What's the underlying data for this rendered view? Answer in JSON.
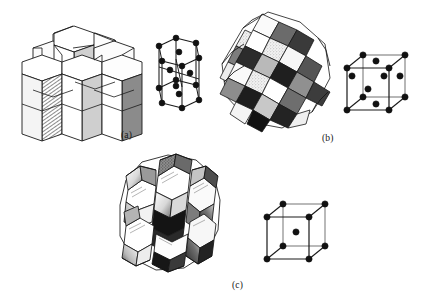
{
  "figure": {
    "background_color": "#ffffff",
    "ink_color": "#1a1a1a",
    "caption_color": "#161616"
  },
  "panels": [
    {
      "id": "a",
      "label": "(a)",
      "label_x": 121,
      "label_y": 130,
      "structure_name": "hexagonal-close-packed",
      "cluster": {
        "name": "hexagonal-prism-cluster",
        "cell_shape": "hexagonal prism",
        "prism_count": 7,
        "shading": [
          "white",
          "light-gray",
          "hatched",
          "dark-gray"
        ]
      },
      "unit_cell": {
        "name": "hcp-unit-cell",
        "shape": "hexagonal prism",
        "corner_atoms": 12,
        "face_center_atoms": 2,
        "interior_atoms": 3,
        "total_atom_markers": 17
      }
    },
    {
      "id": "b",
      "label": "(b)",
      "label_x": 322,
      "label_y": 133,
      "structure_name": "face-centered-cubic",
      "cluster": {
        "name": "rhombic-dodecahedra-cluster",
        "cell_shape": "rhombic dodecahedron",
        "shading": [
          "white",
          "light-gray",
          "mid-gray",
          "black"
        ]
      },
      "unit_cell": {
        "name": "fcc-unit-cell",
        "shape": "cube",
        "corner_atoms": 8,
        "face_center_atoms": 6,
        "interior_atoms": 0,
        "total_atom_markers": 14
      }
    },
    {
      "id": "c",
      "label": "(c)",
      "label_x": 232,
      "label_y": 280,
      "structure_name": "body-centered-cubic",
      "cluster": {
        "name": "truncated-octahedra-cluster",
        "cell_shape": "truncated octahedron",
        "shading": [
          "white",
          "light-gray",
          "hatched",
          "black"
        ]
      },
      "unit_cell": {
        "name": "bcc-unit-cell",
        "shape": "cube",
        "corner_atoms": 8,
        "face_center_atoms": 0,
        "interior_atoms": 1,
        "total_atom_markers": 9
      }
    }
  ]
}
